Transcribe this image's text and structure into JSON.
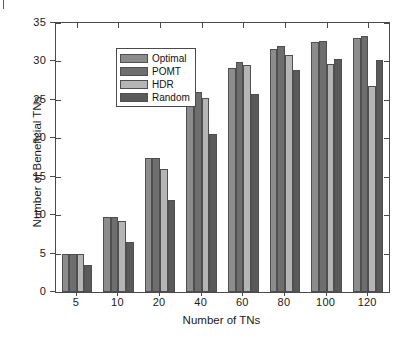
{
  "chart_data": {
    "type": "bar",
    "title": "",
    "xlabel": "Number of TNs",
    "ylabel": "Number of Beneficial TNs",
    "categories": [
      "5",
      "10",
      "20",
      "40",
      "60",
      "80",
      "100",
      "120"
    ],
    "xlim_categories": 8,
    "ylim": [
      0,
      35
    ],
    "yticks": [
      0,
      5,
      10,
      15,
      20,
      25,
      30,
      35
    ],
    "grid": false,
    "legend_position": "upper left",
    "series": [
      {
        "name": "Optimal",
        "color": "#8c8c8c",
        "values": [
          5.0,
          9.8,
          17.5,
          24.3,
          29.1,
          31.6,
          32.5,
          33.0
        ]
      },
      {
        "name": "POMT",
        "color": "#6e6e6e",
        "values": [
          5.0,
          9.8,
          17.5,
          26.0,
          29.9,
          32.0,
          32.7,
          33.3
        ]
      },
      {
        "name": "HDR",
        "color": "#b5b5b5",
        "values": [
          5.0,
          9.2,
          16.0,
          25.2,
          29.6,
          30.9,
          29.7,
          26.8
        ]
      },
      {
        "name": "Random",
        "color": "#5a5a5a",
        "values": [
          3.5,
          6.5,
          12.0,
          20.5,
          25.8,
          28.9,
          30.3,
          30.2
        ]
      }
    ]
  },
  "axes": {
    "y_title": "Number of Beneficial TNs",
    "x_title": "Number of TNs",
    "y_tick_labels": [
      "0",
      "5",
      "10",
      "15",
      "20",
      "25",
      "30",
      "35"
    ],
    "x_tick_labels": [
      "5",
      "10",
      "20",
      "40",
      "60",
      "80",
      "100",
      "120"
    ]
  },
  "legend": {
    "entries": [
      {
        "label": "Optimal",
        "color": "#8c8c8c"
      },
      {
        "label": "POMT",
        "color": "#6e6e6e"
      },
      {
        "label": "HDR",
        "color": "#b5b5b5"
      },
      {
        "label": "Random",
        "color": "#5a5a5a"
      }
    ]
  },
  "colors": {
    "axis": "#4a4a4a",
    "text": "#1a1a1a",
    "background": "#ffffff"
  }
}
